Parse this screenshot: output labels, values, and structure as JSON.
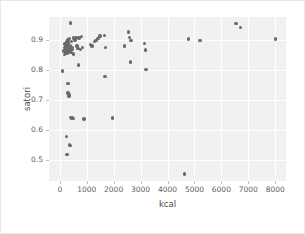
{
  "chart_data": {
    "type": "scatter",
    "title": "",
    "xlabel": "kcal",
    "ylabel": "satori",
    "xlim": [
      -400,
      8400
    ],
    "ylim": [
      0.43,
      0.975
    ],
    "grid": true,
    "legend": null,
    "xticks": [
      0,
      1000,
      2000,
      3000,
      4000,
      5000,
      6000,
      7000,
      8000
    ],
    "xticklabels": [
      "0",
      "1000",
      "2000",
      "3000",
      "4000",
      "5000",
      "6000",
      "7000",
      "8000"
    ],
    "yticks": [
      0.5,
      0.6,
      0.7,
      0.8,
      0.9
    ],
    "yticklabels": [
      "0.5",
      "0.6",
      "0.7",
      "0.8",
      "0.9"
    ],
    "marker_color": "#6a6a6a",
    "plot_background": "#f1f1f1",
    "grid_color": "#ffffff",
    "points": [
      {
        "x": 100,
        "y": 0.795
      },
      {
        "x": 150,
        "y": 0.862
      },
      {
        "x": 170,
        "y": 0.874
      },
      {
        "x": 180,
        "y": 0.851
      },
      {
        "x": 200,
        "y": 0.885
      },
      {
        "x": 210,
        "y": 0.866
      },
      {
        "x": 215,
        "y": 0.858
      },
      {
        "x": 230,
        "y": 0.878
      },
      {
        "x": 240,
        "y": 0.869
      },
      {
        "x": 250,
        "y": 0.893
      },
      {
        "x": 255,
        "y": 0.862
      },
      {
        "x": 265,
        "y": 0.872
      },
      {
        "x": 270,
        "y": 0.855
      },
      {
        "x": 280,
        "y": 0.884
      },
      {
        "x": 290,
        "y": 0.866
      },
      {
        "x": 300,
        "y": 0.899
      },
      {
        "x": 310,
        "y": 0.876
      },
      {
        "x": 320,
        "y": 0.861
      },
      {
        "x": 330,
        "y": 0.889
      },
      {
        "x": 345,
        "y": 0.871
      },
      {
        "x": 360,
        "y": 0.903
      },
      {
        "x": 375,
        "y": 0.864
      },
      {
        "x": 390,
        "y": 0.881
      },
      {
        "x": 400,
        "y": 0.955
      },
      {
        "x": 410,
        "y": 0.858
      },
      {
        "x": 430,
        "y": 0.893
      },
      {
        "x": 450,
        "y": 0.874
      },
      {
        "x": 470,
        "y": 0.868
      },
      {
        "x": 500,
        "y": 0.905
      },
      {
        "x": 520,
        "y": 0.852
      },
      {
        "x": 560,
        "y": 0.898
      },
      {
        "x": 600,
        "y": 0.907
      },
      {
        "x": 640,
        "y": 0.879
      },
      {
        "x": 680,
        "y": 0.871
      },
      {
        "x": 720,
        "y": 0.905
      },
      {
        "x": 760,
        "y": 0.868
      },
      {
        "x": 800,
        "y": 0.911
      },
      {
        "x": 850,
        "y": 0.873
      },
      {
        "x": 310,
        "y": 0.755
      },
      {
        "x": 300,
        "y": 0.722
      },
      {
        "x": 340,
        "y": 0.718
      },
      {
        "x": 345,
        "y": 0.713
      },
      {
        "x": 700,
        "y": 0.816
      },
      {
        "x": 260,
        "y": 0.577
      },
      {
        "x": 370,
        "y": 0.552
      },
      {
        "x": 380,
        "y": 0.548
      },
      {
        "x": 270,
        "y": 0.519
      },
      {
        "x": 420,
        "y": 0.641
      },
      {
        "x": 450,
        "y": 0.638
      },
      {
        "x": 470,
        "y": 0.639
      },
      {
        "x": 500,
        "y": 0.637
      },
      {
        "x": 900,
        "y": 0.636
      },
      {
        "x": 1150,
        "y": 0.884
      },
      {
        "x": 1200,
        "y": 0.879
      },
      {
        "x": 1280,
        "y": 0.893
      },
      {
        "x": 1350,
        "y": 0.896
      },
      {
        "x": 1420,
        "y": 0.903
      },
      {
        "x": 1500,
        "y": 0.912
      },
      {
        "x": 1650,
        "y": 0.914
      },
      {
        "x": 1700,
        "y": 0.873
      },
      {
        "x": 1680,
        "y": 0.777
      },
      {
        "x": 1950,
        "y": 0.639
      },
      {
        "x": 2400,
        "y": 0.879
      },
      {
        "x": 2550,
        "y": 0.925
      },
      {
        "x": 2600,
        "y": 0.906
      },
      {
        "x": 2650,
        "y": 0.897
      },
      {
        "x": 2620,
        "y": 0.826
      },
      {
        "x": 3150,
        "y": 0.887
      },
      {
        "x": 3180,
        "y": 0.866
      },
      {
        "x": 3200,
        "y": 0.801
      },
      {
        "x": 4620,
        "y": 0.453
      },
      {
        "x": 4780,
        "y": 0.902
      },
      {
        "x": 5200,
        "y": 0.896
      },
      {
        "x": 6550,
        "y": 0.953
      },
      {
        "x": 6700,
        "y": 0.941
      },
      {
        "x": 8000,
        "y": 0.902
      }
    ]
  }
}
